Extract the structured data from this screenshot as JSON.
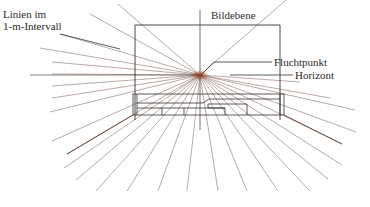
{
  "diagram": {
    "type": "perspective-construction",
    "labels": {
      "lines_interval_line1": "Linien im",
      "lines_interval_line2": "1-m-Intervall",
      "image_plane": "Bildebene",
      "vanishing_point": "Fluchtpunkt",
      "horizon": "Horizont"
    },
    "vanishing_point": {
      "x": 200,
      "y": 75
    },
    "image_plane_rect": {
      "x": 135,
      "y": 25,
      "w": 145,
      "h": 95
    },
    "colors": {
      "ray": "#8a6a60",
      "ray_center": "#a0401a",
      "frame": "#333333",
      "text": "#2a2a2a"
    }
  }
}
